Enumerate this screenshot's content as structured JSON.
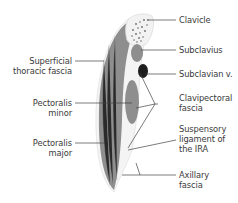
{
  "diagram": {
    "type": "anatomical cross-section",
    "labels_left": [
      {
        "id": "superficial-thoracic-fascia",
        "line1": "Superficial",
        "line2": "thoracic fascia"
      },
      {
        "id": "pectoralis-minor",
        "line1": "Pectoralis",
        "line2": "minor"
      },
      {
        "id": "pectoralis-major",
        "line1": "Pectoralis",
        "line2": "major"
      }
    ],
    "labels_right": [
      {
        "id": "clavicle",
        "line1": "Clavicle"
      },
      {
        "id": "subclavius",
        "line1": "Subclavius"
      },
      {
        "id": "subclavian-vein",
        "line1": "Subclavian v."
      },
      {
        "id": "clavipectoral-fascia",
        "line1": "Clavipectoral",
        "line2": "fascia"
      },
      {
        "id": "suspensory-ligament",
        "line1": "Suspensory",
        "line2": "ligament of",
        "line3": "the IRA"
      },
      {
        "id": "axillary-fascia",
        "line1": "Axillary",
        "line2": "fascia"
      }
    ],
    "colors": {
      "muscle": "#8e8e8e",
      "vein": "#1e1e1e",
      "bone_outline": "#e6e6e6",
      "leader": "#444444",
      "text": "#3a3a3a"
    }
  }
}
